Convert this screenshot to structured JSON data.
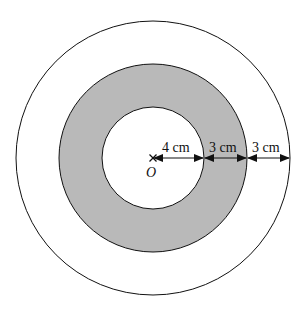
{
  "diagram": {
    "type": "concentric-circles",
    "center": {
      "label": "O",
      "marker": "cross-icon"
    },
    "circles": [
      {
        "name": "inner",
        "radius_cm": 4,
        "fill": "#ffffff"
      },
      {
        "name": "middle",
        "radius_cm": 7,
        "fill": "#b9b9b9"
      },
      {
        "name": "outer",
        "radius_cm": 10,
        "fill": "#ffffff"
      }
    ],
    "shaded_region": "annulus between inner and middle circles",
    "dimensions": [
      {
        "label": "4 cm",
        "from": "O",
        "to": "inner circle"
      },
      {
        "label": "3 cm",
        "from": "inner circle",
        "to": "middle circle"
      },
      {
        "label": "3 cm",
        "from": "middle circle",
        "to": "outer circle"
      }
    ],
    "colors": {
      "stroke": "#111111",
      "shade": "#b9b9b9",
      "background": "#ffffff"
    }
  }
}
